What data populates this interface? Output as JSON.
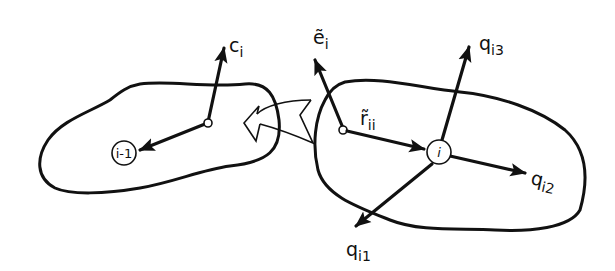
{
  "diagram": {
    "type": "rigid-body kinematic chain",
    "colors": {
      "stroke": "#111111",
      "background": "#ffffff"
    },
    "bodies": [
      {
        "id": "body-i-minus-1",
        "node_label": "i-1"
      },
      {
        "id": "body-i",
        "node_label": "i"
      }
    ],
    "vectors": {
      "c": {
        "base": "c",
        "subscript": "i"
      },
      "e": {
        "base": "ẽ",
        "subscript": "i"
      },
      "r": {
        "base": "r̃",
        "subscript": "ii"
      },
      "q1": {
        "base": "q",
        "subscript": "i1"
      },
      "q2": {
        "base": "q",
        "subscript": "i2"
      },
      "q3": {
        "base": "q",
        "subscript": "i3"
      }
    },
    "connector": {
      "kind": "hollow curved arrow",
      "from": "body-i",
      "to": "body-i-minus-1"
    }
  }
}
